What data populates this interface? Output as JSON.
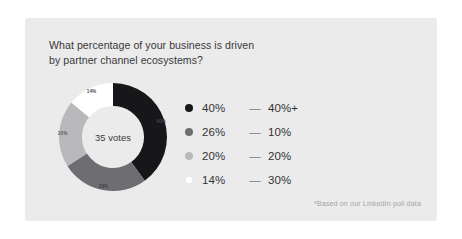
{
  "card": {
    "background_color": "#ebebeb",
    "title": "What percentage of your business is driven\nby partner channel ecosystems?",
    "footnote": "*Based on our LinkedIn poll data"
  },
  "chart_data": {
    "type": "pie",
    "variant": "donut",
    "title": "What percentage of your business is driven by partner channel ecosystems?",
    "center_label": "35 votes",
    "total_votes": 35,
    "unit": "%",
    "start_angle_deg": 0,
    "direction": "clockwise",
    "legend_position": "right",
    "grid": false,
    "categories": [
      "40%+",
      "10%",
      "20%",
      "30%"
    ],
    "values": [
      40,
      26,
      20,
      14
    ],
    "slice_labels": [
      "40%",
      "26%",
      "20%",
      "14%"
    ],
    "colors": [
      "#17171a",
      "#6e6e72",
      "#b9b9bb",
      "#ffffff"
    ],
    "slice_label_colors": [
      "#46464a",
      "#3f3f42",
      "#5c5c5f",
      "#4a4a4d"
    ],
    "slices": [
      {
        "label": "40%",
        "category": "40%+",
        "value": 40,
        "color": "#17171a"
      },
      {
        "label": "26%",
        "category": "10%",
        "value": 26,
        "color": "#6e6e72"
      },
      {
        "label": "20%",
        "category": "20%",
        "value": 20,
        "color": "#b9b9bb"
      },
      {
        "label": "14%",
        "category": "30%",
        "value": 14,
        "color": "#ffffff"
      }
    ]
  },
  "legend": {
    "separator": "—",
    "rows": [
      {
        "percent": "40%",
        "dash": "—",
        "value": "40%+",
        "color": "#17171a"
      },
      {
        "percent": "26%",
        "dash": "—",
        "value": "10%",
        "color": "#6e6e72"
      },
      {
        "percent": "20%",
        "dash": "—",
        "value": "20%",
        "color": "#b9b9bb"
      },
      {
        "percent": "14%",
        "dash": "—",
        "value": "30%",
        "color": "#ffffff"
      }
    ]
  }
}
